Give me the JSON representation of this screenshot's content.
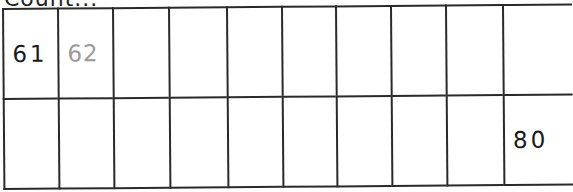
{
  "heading": "Count...",
  "grid": {
    "columns": 10,
    "column_widths": [
      55,
      55,
      56,
      58,
      55,
      54,
      55,
      55,
      57,
      70
    ],
    "rows": [
      [
        "61",
        "62",
        "",
        "",
        "",
        "",
        "",
        "",
        "",
        ""
      ],
      [
        "",
        "",
        "",
        "",
        "",
        "",
        "",
        "",
        "",
        "80"
      ]
    ],
    "styles": {
      "61": "dark",
      "62": "muted",
      "80": "dark"
    }
  },
  "colors": {
    "line": "#2a2a2a",
    "text": "#1a1a1a",
    "muted_text": "#9a9a9a",
    "background": "#ffffff"
  }
}
